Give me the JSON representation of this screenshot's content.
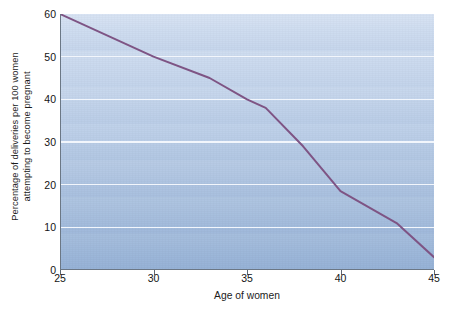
{
  "chart_data": {
    "type": "line",
    "title": "",
    "xlabel": "Age of women",
    "ylabel_line1": "Percentage of deliveries per 100 women",
    "ylabel_line2": "attempting to become pregnant",
    "xlim": [
      25,
      45
    ],
    "ylim": [
      0,
      60
    ],
    "xticks": [
      25,
      30,
      35,
      40,
      45
    ],
    "xtick_labels": [
      "25",
      "30",
      "35",
      "40",
      "45"
    ],
    "yticks": [
      0,
      10,
      20,
      30,
      40,
      50,
      60
    ],
    "ytick_labels": [
      "0",
      "10",
      "20",
      "30",
      "40",
      "50",
      "60"
    ],
    "grid": "horizontal",
    "legend": "none",
    "series": [
      {
        "name": "Deliveries per 100 women attempting to become pregnant",
        "color": "#7e5484",
        "line_width": 2,
        "x": [
          25,
          30,
          33,
          35,
          36,
          38,
          40,
          43,
          45
        ],
        "y": [
          60,
          50,
          45,
          40,
          38,
          29,
          18.5,
          11,
          3
        ]
      }
    ],
    "colors": {
      "line": "#7e5484",
      "plot_bg_top": "#d8e3f3",
      "plot_bg_bottom": "#96b2d7",
      "gridline": "#f2f6fc",
      "axis": "#6b7785",
      "text": "#141414",
      "page_bg": "#ffffff"
    }
  }
}
